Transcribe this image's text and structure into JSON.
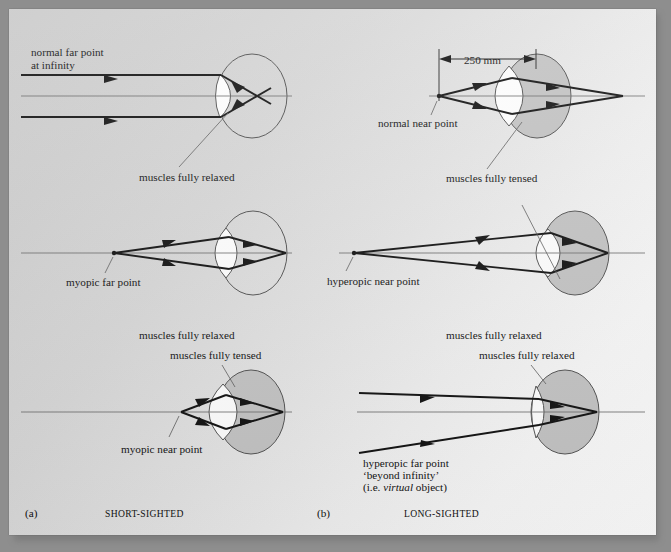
{
  "figure": {
    "title_present": false,
    "panels": [
      {
        "key": "a",
        "panel_label": "(a)",
        "caption": "SHORT-SIGHTED",
        "rows": [
          {
            "key": "a1",
            "source_label": "normal far point\nat infinity",
            "source_label_line1": "normal far point",
            "source_label_line2": "at infinity",
            "muscle_label": "muscles fully relaxed",
            "eye_fill": "none",
            "lens_shape": "thin",
            "rays": "parallel",
            "focus": "crosses in front of retina"
          },
          {
            "key": "a2",
            "source_label": "myopic far point",
            "muscle_label": "muscles fully relaxed",
            "eye_fill": "none",
            "lens_shape": "thin",
            "rays": "diverging from far point",
            "focus": "on retina"
          },
          {
            "key": "a3",
            "source_label": "myopic near point",
            "muscle_label": "muscles fully tensed",
            "eye_fill": "gray",
            "lens_shape": "thick",
            "rays": "diverging from near point",
            "focus": "on retina"
          }
        ]
      },
      {
        "key": "b",
        "panel_label": "(b)",
        "caption": "LONG-SIGHTED",
        "rows": [
          {
            "key": "b1",
            "source_label": "normal near point",
            "muscle_label": "muscles fully tensed",
            "dimension_label": "250 mm",
            "eye_fill": "gray",
            "lens_shape": "thick",
            "rays": "diverging from near point",
            "focus": "behind retina"
          },
          {
            "key": "b2",
            "source_label": "hyperopic near point",
            "muscle_label": "muscles fully relaxed",
            "eye_fill": "gray",
            "lens_shape": "thick",
            "rays": "diverging from near point",
            "focus": "on retina"
          },
          {
            "key": "b3",
            "source_label_line1": "hyperopic far point",
            "source_label_line2": "‘beyond infinity’",
            "source_label_line3_a": "(i.e. ",
            "source_label_line3_italic": "virtual",
            "source_label_line3_b": " object)",
            "muscle_label": "muscles fully relaxed",
            "eye_fill": "gray",
            "lens_shape": "thin",
            "rays": "converging toward virtual object",
            "focus": "on retina"
          }
        ]
      }
    ]
  },
  "colors": {
    "page_light": "#fbfbfb",
    "page_dark": "#c9c9c9",
    "ray": "#111111",
    "axis": "#6a6a6a",
    "eye_fill_gray": "#c2c2c2",
    "lens_white": "#fdfdfd",
    "outline": "#4a4a4a",
    "text": "#101010"
  }
}
